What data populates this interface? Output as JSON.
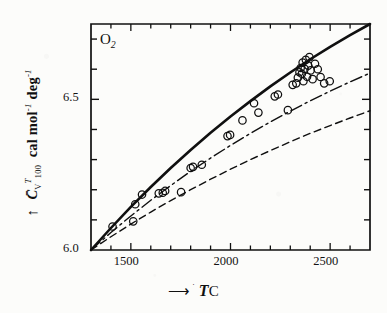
{
  "figure": {
    "species_label": "O",
    "species_subscript": "2",
    "background_color": "#fcfcfa",
    "ink_color": "#101010"
  },
  "axes": {
    "y_label_symbol": "C",
    "y_label_symbol_sub": "V",
    "y_label_symbol_sup": "T",
    "y_label_symbol_sub2": "100",
    "y_label_units": "cal mol",
    "y_label_units_sup1": "-1",
    "y_label_units_2": "deg",
    "y_label_units_sup2": "-1",
    "y_arrow": "↑",
    "x_arrow": "⟶",
    "x_label_t": "T",
    "x_label_deg": "˙",
    "x_label_c": "C",
    "x_ticklabels": [
      "1500",
      "2000",
      "2500"
    ],
    "y_ticklabels": [
      "6.0",
      "6.5"
    ]
  },
  "chart_data": {
    "type": "line",
    "title": "",
    "subtitle": "",
    "annotations": [
      "O2"
    ],
    "xlabel": "T  °C",
    "ylabel": "C̄_V^T_100  cal mol^-1 deg^-1",
    "xlim": [
      1300,
      2700
    ],
    "ylim": [
      6.0,
      6.75
    ],
    "x_major_ticks": [
      1500,
      2000,
      2500
    ],
    "x_minor_tick_step": 100,
    "y_major_ticks": [
      6.0,
      6.5
    ],
    "y_minor_tick_step": 0.1,
    "grid": false,
    "legend": "none",
    "series": [
      {
        "name": "experimental-fit-solid",
        "style": "solid",
        "linewidth": 2.6,
        "x": [
          1300,
          1400,
          1500,
          1600,
          1700,
          1800,
          1900,
          2000,
          2100,
          2200,
          2300,
          2400,
          2500,
          2600,
          2700
        ],
        "y": [
          6.0,
          6.073,
          6.143,
          6.209,
          6.272,
          6.332,
          6.389,
          6.443,
          6.494,
          6.543,
          6.589,
          6.633,
          6.674,
          6.713,
          6.75
        ]
      },
      {
        "name": "theory-dash-dot",
        "style": "dashdot",
        "linewidth": 1.4,
        "x": [
          1300,
          1400,
          1500,
          1600,
          1700,
          1800,
          1900,
          2000,
          2100,
          2200,
          2300,
          2400,
          2500,
          2600,
          2700
        ],
        "y": [
          6.0,
          6.058,
          6.113,
          6.165,
          6.214,
          6.261,
          6.305,
          6.347,
          6.387,
          6.425,
          6.461,
          6.495,
          6.527,
          6.558,
          6.587
        ]
      },
      {
        "name": "theory-dashed",
        "style": "dashed",
        "linewidth": 1.4,
        "x": [
          1300,
          1400,
          1500,
          1600,
          1700,
          1800,
          1900,
          2000,
          2100,
          2200,
          2300,
          2400,
          2500,
          2600,
          2700
        ],
        "y": [
          6.0,
          6.044,
          6.086,
          6.126,
          6.164,
          6.2,
          6.235,
          6.268,
          6.3,
          6.33,
          6.359,
          6.387,
          6.413,
          6.438,
          6.462
        ]
      }
    ],
    "scatter": {
      "name": "measured-points",
      "marker": "open-circle",
      "marker_size": 5,
      "points": [
        [
          1408,
          6.078
        ],
        [
          1512,
          6.095
        ],
        [
          1522,
          6.152
        ],
        [
          1556,
          6.184
        ],
        [
          1640,
          6.188
        ],
        [
          1660,
          6.19
        ],
        [
          1672,
          6.196
        ],
        [
          1752,
          6.192
        ],
        [
          1800,
          6.272
        ],
        [
          1812,
          6.276
        ],
        [
          1856,
          6.283
        ],
        [
          1985,
          6.378
        ],
        [
          1998,
          6.382
        ],
        [
          2060,
          6.43
        ],
        [
          2118,
          6.487
        ],
        [
          2140,
          6.456
        ],
        [
          2222,
          6.51
        ],
        [
          2238,
          6.516
        ],
        [
          2288,
          6.464
        ],
        [
          2312,
          6.548
        ],
        [
          2330,
          6.553
        ],
        [
          2338,
          6.572
        ],
        [
          2346,
          6.59
        ],
        [
          2352,
          6.604
        ],
        [
          2358,
          6.585
        ],
        [
          2362,
          6.622
        ],
        [
          2366,
          6.56
        ],
        [
          2372,
          6.601
        ],
        [
          2378,
          6.631
        ],
        [
          2384,
          6.575
        ],
        [
          2390,
          6.612
        ],
        [
          2396,
          6.64
        ],
        [
          2402,
          6.596
        ],
        [
          2412,
          6.567
        ],
        [
          2424,
          6.618
        ],
        [
          2438,
          6.6
        ],
        [
          2452,
          6.574
        ],
        [
          2470,
          6.553
        ],
        [
          2498,
          6.56
        ]
      ]
    }
  }
}
